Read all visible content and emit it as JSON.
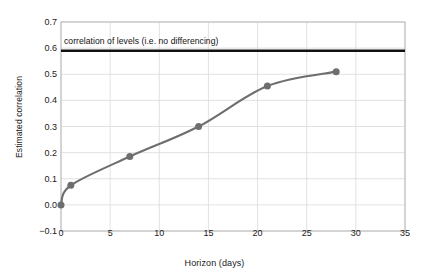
{
  "chart_data": {
    "type": "line",
    "title": "",
    "xlabel": "Horizon (days)",
    "ylabel": "Estimated correlation",
    "xlim": [
      0,
      35
    ],
    "ylim": [
      -0.1,
      0.7
    ],
    "xticks": [
      0,
      5,
      10,
      15,
      20,
      25,
      30,
      35
    ],
    "yticks": [
      -0.1,
      0.0,
      0.1,
      0.2,
      0.3,
      0.4,
      0.5,
      0.6,
      0.7
    ],
    "xtick_labels": [
      "0",
      "5",
      "10",
      "15",
      "20",
      "25",
      "30",
      "35"
    ],
    "ytick_labels": [
      "-0.1",
      "0.0",
      "0.1",
      "0.2",
      "0.3",
      "0.4",
      "0.5",
      "0.6",
      "0.7"
    ],
    "grid": true,
    "legend": "none",
    "series": [
      {
        "name": "Estimated correlation",
        "marker": "circle",
        "color": "#6e6e6e",
        "x": [
          0,
          1,
          7,
          14,
          21,
          28
        ],
        "values": [
          0.0,
          0.075,
          0.185,
          0.3,
          0.455,
          0.51
        ]
      }
    ],
    "annotations": [
      {
        "type": "hline",
        "label": "correlation of levels (i.e. no differencing)",
        "y": 0.59,
        "color": "#111111",
        "x_start": 0,
        "x_end": 35
      }
    ]
  },
  "axes": {
    "x_title": "Horizon (days)",
    "y_title": "Estimated correlation"
  },
  "annotation": {
    "text": "correlation of levels (i.e. no differencing)"
  },
  "colors": {
    "line": "#6e6e6e",
    "marker": "#6e6e6e",
    "grid": "#d9d9d9",
    "frame": "#b8b8b8",
    "hline": "#111111",
    "text": "#1a1a1a",
    "background": "#ffffff"
  }
}
